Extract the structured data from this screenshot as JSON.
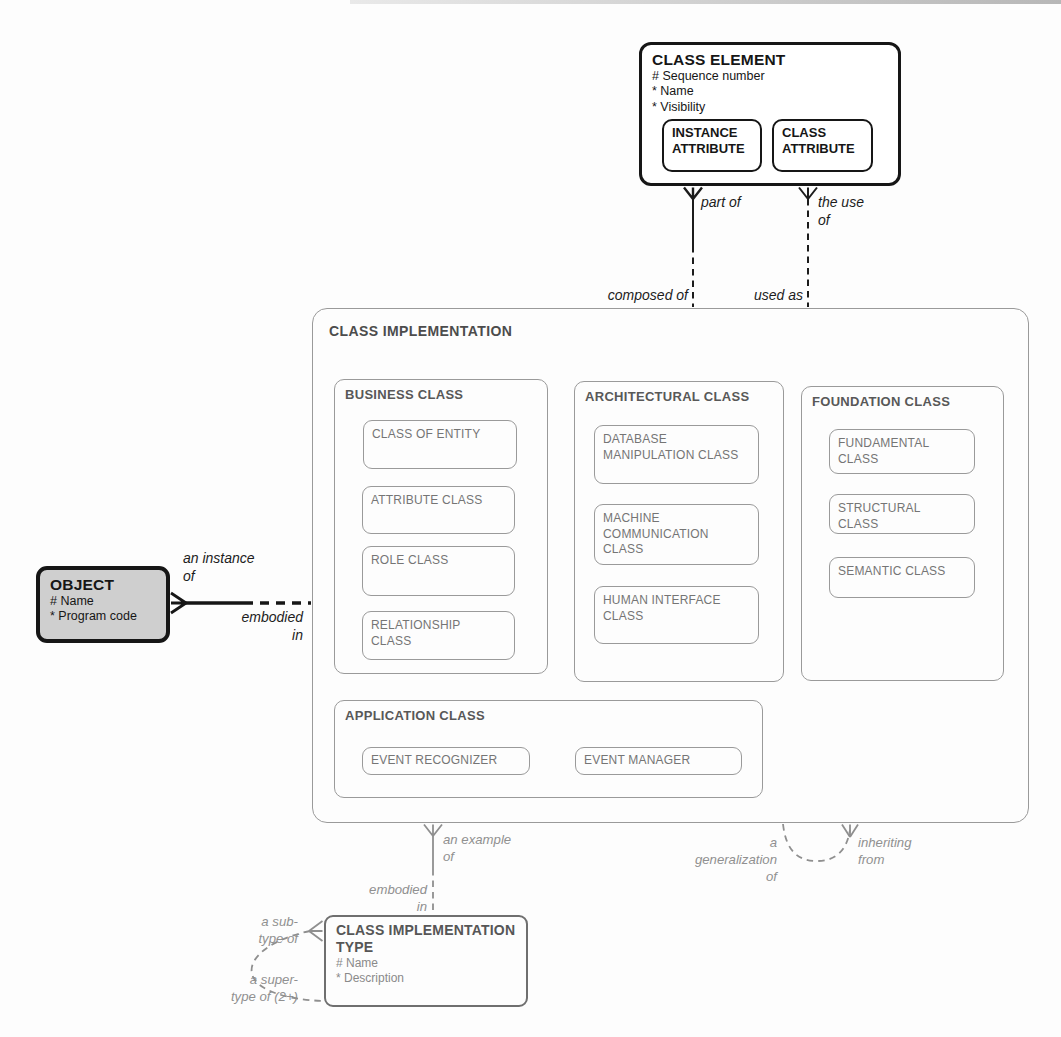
{
  "entities": {
    "class_element": {
      "title": "CLASS ELEMENT",
      "attributes": [
        "# Sequence number",
        "* Name",
        "* Visibility"
      ],
      "subtypes": [
        {
          "title": "INSTANCE\nATTRIBUTE"
        },
        {
          "title": "CLASS\nATTRIBUTE"
        }
      ]
    },
    "object": {
      "title": "OBJECT",
      "attributes": [
        "# Name",
        "* Program code"
      ]
    },
    "class_implementation": {
      "title": "CLASS IMPLEMENTATION",
      "subtypes": [
        {
          "title": "BUSINESS CLASS",
          "children": [
            "CLASS OF ENTITY",
            "ATTRIBUTE CLASS",
            "ROLE CLASS",
            "RELATIONSHIP\nCLASS"
          ]
        },
        {
          "title": "ARCHITECTURAL CLASS",
          "children": [
            "DATABASE\nMANIPULATION CLASS",
            "MACHINE\nCOMMUNICATION\nCLASS",
            "HUMAN INTERFACE\nCLASS"
          ]
        },
        {
          "title": "FOUNDATION CLASS",
          "children": [
            "FUNDAMENTAL\nCLASS",
            "STRUCTURAL\nCLASS",
            "SEMANTIC CLASS"
          ]
        },
        {
          "title": "APPLICATION CLASS",
          "children": [
            "EVENT RECOGNIZER",
            "EVENT MANAGER"
          ]
        }
      ]
    },
    "class_implementation_type": {
      "title": "CLASS IMPLEMENTATION\nTYPE",
      "attributes": [
        "# Name",
        "* Description"
      ]
    }
  },
  "relationships": {
    "part_of": "part of",
    "the_use_of": "the use\nof",
    "composed_of": "composed of",
    "used_as": "used as",
    "an_instance_of": "an instance\nof",
    "embodied_in_object": "embodied\nin",
    "an_example_of": "an example\nof",
    "embodied_in_type": "embodied\nin",
    "a_generalization_of": "a\ngeneralization\nof",
    "inheriting_from": "inheriting\nfrom",
    "a_sub_type_of": "a sub-\ntype of",
    "a_super_type_of": "a super-\ntype of (2+)"
  },
  "colors": {
    "ink": "#1c1c1c",
    "gray_line": "#8f8f8f",
    "box_border_gray": "#9a9a9a",
    "object_fill": "#cfcfcf",
    "label_gray": "#909090"
  }
}
